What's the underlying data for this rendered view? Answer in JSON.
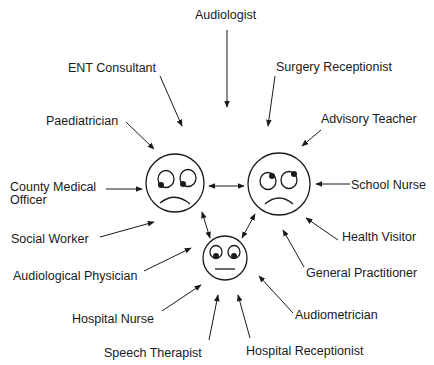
{
  "diagram": {
    "faces": [
      {
        "id": "parent-1",
        "expression": "sad, eyes looking down-left",
        "center": [
          175,
          183
        ],
        "radius": 29
      },
      {
        "id": "parent-2",
        "expression": "sad, eyes looking up-right",
        "center": [
          279,
          184
        ],
        "radius": 31
      },
      {
        "id": "child",
        "expression": "neutral, eyes looking down",
        "center": [
          225,
          258
        ],
        "radius": 22
      }
    ],
    "labels": {
      "audiologist": "Audiologist",
      "ent_consultant": "ENT Consultant",
      "surgery_receptionist": "Surgery Receptionist",
      "paediatrician": "Paediatrician",
      "advisory_teacher": "Advisory Teacher",
      "county_medical_officer_line1": "County Medical",
      "county_medical_officer_line2": "Officer",
      "school_nurse": "School Nurse",
      "social_worker": "Social Worker",
      "health_visitor": "Health Visitor",
      "audiological_physician": "Audiological Physician",
      "general_practitioner": "General Practitioner",
      "hospital_nurse": "Hospital Nurse",
      "audiometrician": "Audiometrician",
      "speech_therapist": "Speech Therapist",
      "hospital_receptionist": "Hospital Receptionist"
    },
    "colors": {
      "line": "#1a1a1a",
      "background": "#ffffff"
    }
  }
}
